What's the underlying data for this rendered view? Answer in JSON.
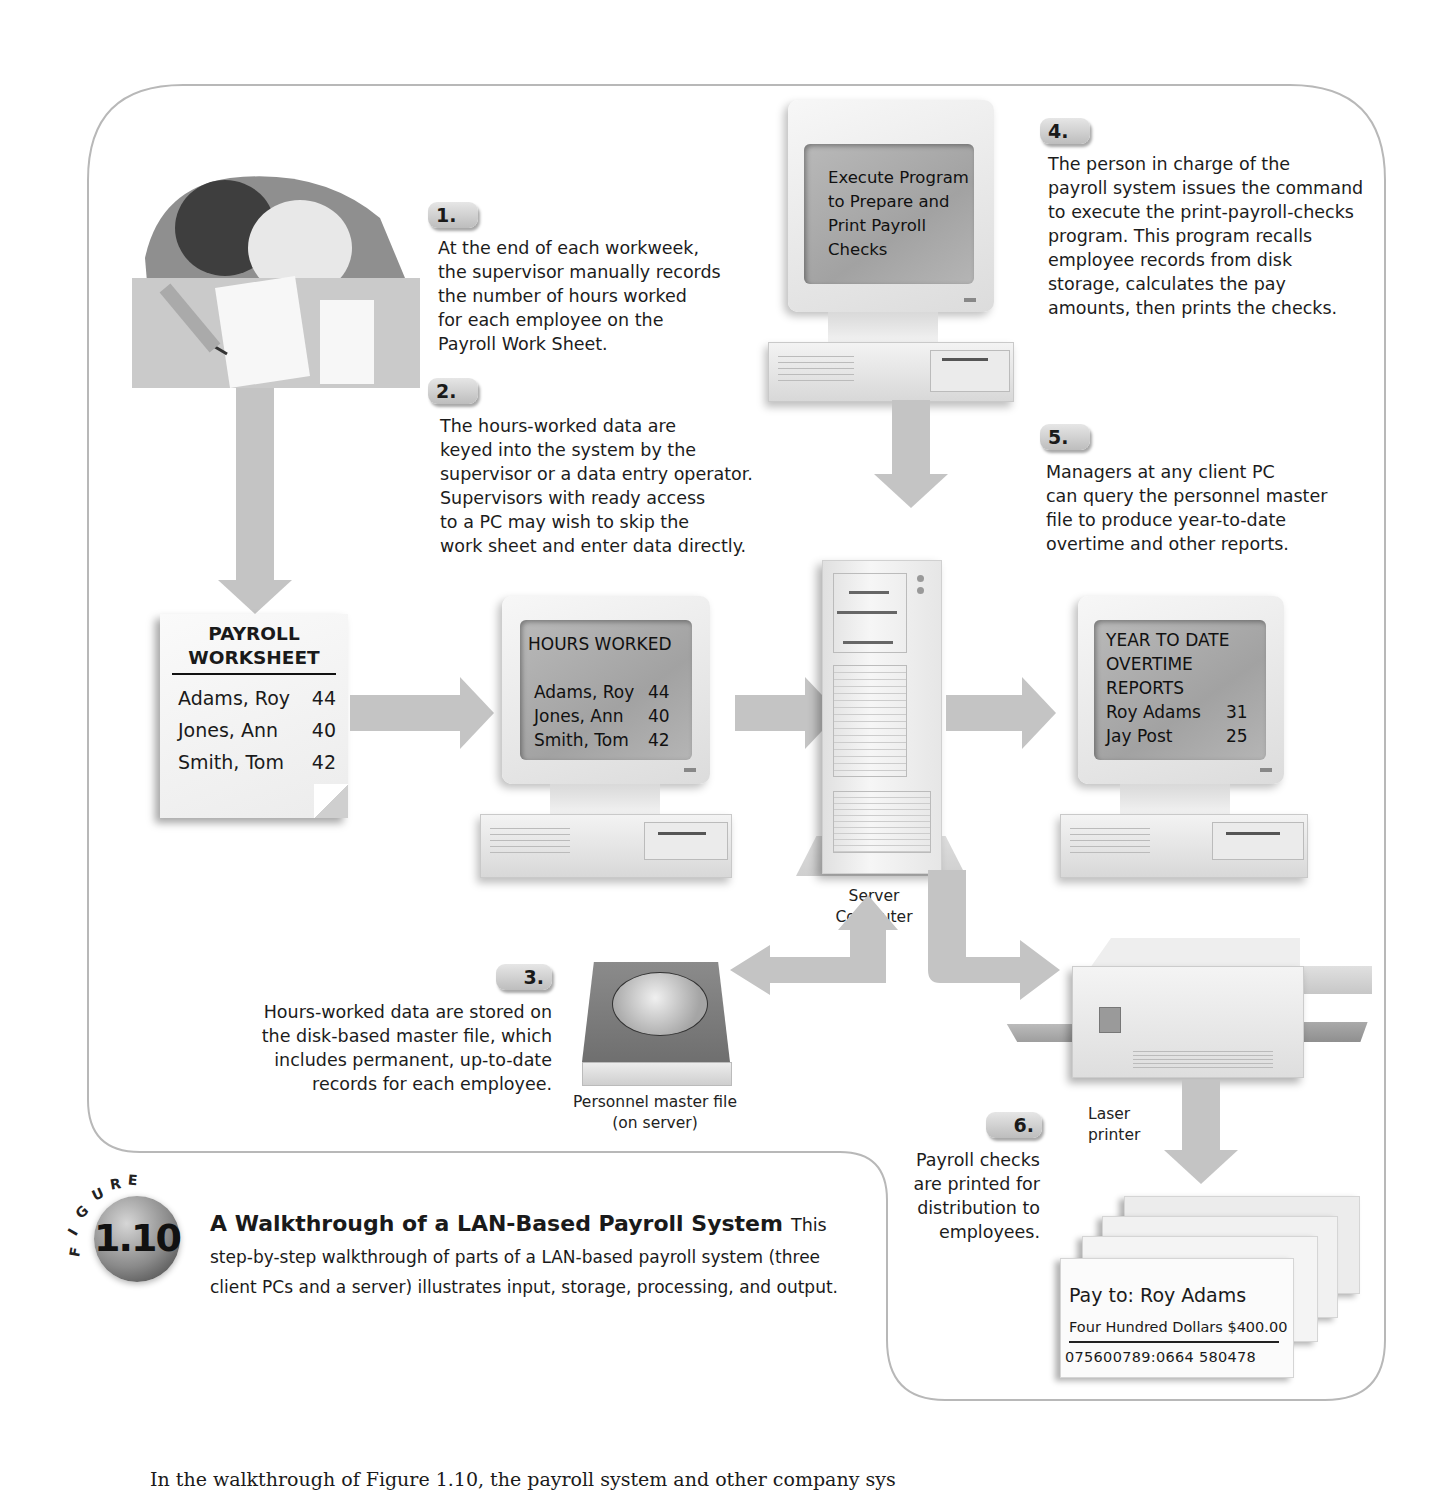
{
  "figure": {
    "label_word": "FIGURE",
    "number": "1.10",
    "title": "A Walkthrough of a LAN-Based Payroll System",
    "lead": "This",
    "description": "step-by-step walkthrough of parts of a LAN-based payroll system (three client PCs and a server) illustrates input, storage, processing, and output."
  },
  "steps": [
    {
      "number": "1.",
      "text": "At the end of each workweek,\nthe supervisor manually records\nthe number of hours worked\nfor each employee on the\nPayroll Work Sheet."
    },
    {
      "number": "2.",
      "text": "The hours-worked data are\nkeyed into the system by the\nsupervisor or a data entry operator.\nSupervisors with ready access\nto a PC may wish to skip the\nwork sheet and enter data directly."
    },
    {
      "number": "3.",
      "text": "Hours-worked data are stored on\nthe disk-based master file, which\nincludes permanent, up-to-date\nrecords for each employee."
    },
    {
      "number": "4.",
      "text": "The person in charge of the\npayroll system issues the command\nto execute the print-payroll-checks\nprogram. This program recalls\nemployee records from disk\nstorage, calculates the pay\namounts, then prints the checks."
    },
    {
      "number": "5.",
      "text": "Managers at any client PC\ncan query the personnel master\nfile to produce year-to-date\novertime and other reports."
    },
    {
      "number": "6.",
      "text": "Payroll checks\nare printed for\ndistribution to\nemployees."
    }
  ],
  "worksheet": {
    "title": "PAYROLL\nWORKSHEET",
    "rows": [
      {
        "name": "Adams, Roy",
        "hours": "44"
      },
      {
        "name": "Jones, Ann",
        "hours": "40"
      },
      {
        "name": "Smith, Tom",
        "hours": "42"
      }
    ]
  },
  "hours_screen": {
    "title": "HOURS WORKED",
    "rows": [
      {
        "name": "Adams, Roy",
        "hours": "44"
      },
      {
        "name": "Jones, Ann",
        "hours": "40"
      },
      {
        "name": "Smith, Tom",
        "hours": "42"
      }
    ]
  },
  "execute_screen": {
    "text": "Execute Program\nto Prepare and\nPrint Payroll\nChecks"
  },
  "report_screen": {
    "title": "YEAR TO DATE\nOVERTIME\nREPORTS",
    "rows": [
      {
        "name": "Roy Adams",
        "hours": "31"
      },
      {
        "name": "Jay Post",
        "hours": "25"
      }
    ]
  },
  "labels": {
    "server": "Server\nComputer",
    "master_file": "Personnel master file\n(on server)",
    "printer": "Laser\nprinter"
  },
  "check": {
    "pay_to": "Pay to: Roy Adams",
    "amount": "Four Hundred Dollars $400.00",
    "micr": "075600789:0664  580478"
  },
  "body_text": "In the walkthrough of Figure 1.10, the payroll system and other company sys"
}
